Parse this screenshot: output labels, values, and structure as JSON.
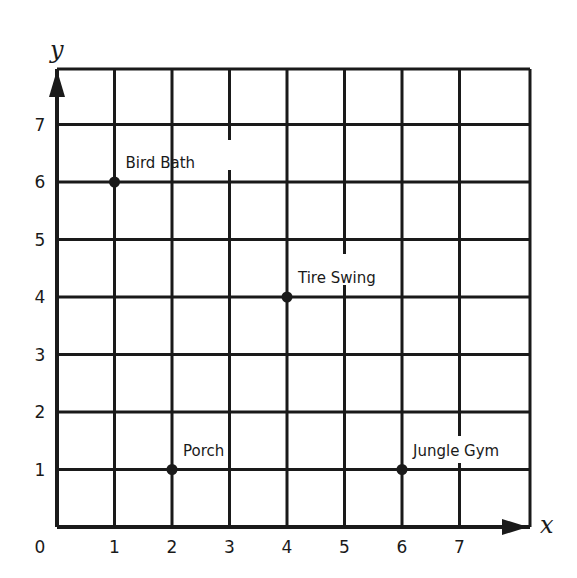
{
  "chart_data": {
    "type": "scatter",
    "title": "",
    "xlabel": "x",
    "ylabel": "y",
    "xlim": [
      0,
      8
    ],
    "ylim": [
      0,
      8
    ],
    "grid": true,
    "x_ticks": [
      "0",
      "1",
      "2",
      "3",
      "4",
      "5",
      "6",
      "7"
    ],
    "y_ticks": [
      "1",
      "2",
      "3",
      "4",
      "5",
      "6",
      "7"
    ],
    "points": [
      {
        "label": "Bird Bath",
        "x": 1,
        "y": 6
      },
      {
        "label": "Tire Swing",
        "x": 4,
        "y": 4
      },
      {
        "label": "Porch",
        "x": 2,
        "y": 1
      },
      {
        "label": "Jungle Gym",
        "x": 6,
        "y": 1
      }
    ],
    "legend": null,
    "colors": {
      "ink": "#1a1a1a",
      "background": "#ffffff"
    }
  }
}
